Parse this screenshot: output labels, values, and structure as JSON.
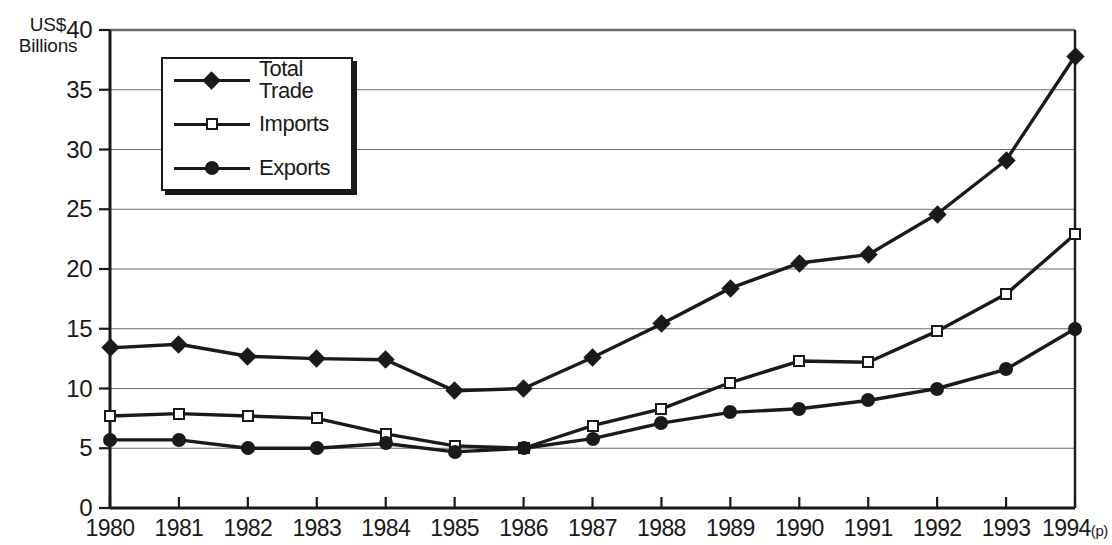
{
  "chart_data": {
    "type": "line",
    "title": "",
    "xlabel": "",
    "ylabel": "US$\nBillions",
    "ylim": [
      0,
      40
    ],
    "yticks": [
      0,
      5,
      10,
      15,
      20,
      25,
      30,
      35,
      40
    ],
    "ytick_labels": [
      "0",
      "5",
      "10",
      "15",
      "20",
      "25",
      "30",
      "35",
      "40"
    ],
    "grid": true,
    "legend_position": "upper-left-inside",
    "categories": [
      "1980",
      "1981",
      "1982",
      "1983",
      "1984",
      "1985",
      "1986",
      "1987",
      "1988",
      "1989",
      "1990",
      "1991",
      "1992",
      "1993",
      "1994"
    ],
    "xtick_labels": [
      "1980",
      "1981",
      "1982",
      "1983",
      "1984",
      "1985",
      "1986",
      "1987",
      "1988",
      "1989",
      "1990",
      "1991",
      "1992",
      "1993",
      "1994"
    ],
    "xtick_suffixes": [
      "",
      "",
      "",
      "",
      "",
      "",
      "",
      "",
      "",
      "",
      "",
      "",
      "",
      "",
      "(p)"
    ],
    "series": [
      {
        "name": "Total Trade",
        "marker": "diamond",
        "values": [
          13.4,
          13.7,
          12.7,
          12.5,
          12.4,
          9.8,
          10.0,
          12.6,
          15.4,
          18.4,
          20.5,
          21.2,
          24.6,
          29.1,
          37.8
        ]
      },
      {
        "name": "Imports",
        "marker": "open-square",
        "values": [
          7.7,
          7.9,
          7.7,
          7.5,
          6.2,
          5.2,
          5.0,
          6.9,
          8.3,
          10.5,
          12.3,
          12.2,
          14.8,
          17.9,
          22.9
        ]
      },
      {
        "name": "Exports",
        "marker": "filled-circle",
        "values": [
          5.7,
          5.7,
          5.0,
          5.0,
          5.4,
          4.7,
          5.0,
          5.8,
          7.1,
          8.0,
          8.3,
          9.0,
          10.0,
          11.6,
          15.0
        ]
      }
    ],
    "colors": {
      "line": "#1a1a1a",
      "grid": "#6b6b6b",
      "axis": "#1a1a1a",
      "background": "#ffffff"
    }
  }
}
